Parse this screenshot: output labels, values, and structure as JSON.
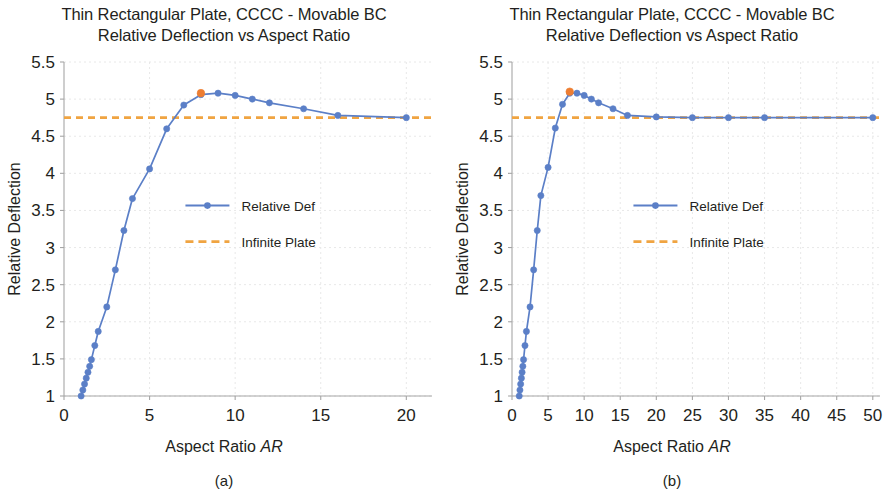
{
  "figure": {
    "panels": [
      {
        "id": "panel-a",
        "caption": "(a)",
        "title_line1": "Thin Rectangular Plate, CCCC - Movable BC",
        "title_line2": "Relative Deflection vs Aspect Ratio",
        "xlabel_text": "Aspect Ratio ",
        "xlabel_italic": "AR",
        "ylabel": "Relative Deflection",
        "legend": [
          {
            "label": "Relative Def",
            "style": "line-marker",
            "color": "#5b7fc7"
          },
          {
            "label": "Infinite Plate",
            "style": "dashed",
            "color": "#f0a441"
          }
        ]
      },
      {
        "id": "panel-b",
        "caption": "(b)",
        "title_line1": "Thin Rectangular Plate, CCCC - Movable BC",
        "title_line2": "Relative Deflection vs Aspect Ratio",
        "xlabel_text": "Aspect Ratio ",
        "xlabel_italic": "AR",
        "ylabel": "Relative Deflection",
        "legend": [
          {
            "label": "Relative Def",
            "style": "line-marker",
            "color": "#5b7fc7"
          },
          {
            "label": "Infinite Plate",
            "style": "dashed",
            "color": "#f0a441"
          }
        ]
      }
    ],
    "colors": {
      "series_blue": "#5b7fc7",
      "highlight_orange": "#ed7d31",
      "infinite_orange": "#f0a441",
      "axis": "#a6a6a6",
      "grid": "#e8e8e8",
      "text": "#231f20"
    }
  },
  "chart_data": [
    {
      "type": "line",
      "panel": "(a)",
      "title": "Thin Rectangular Plate, CCCC - Movable BC\nRelative Deflection vs Aspect Ratio",
      "xlabel": "Aspect Ratio AR",
      "ylabel": "Relative Deflection",
      "xlim": [
        0,
        21.5
      ],
      "ylim": [
        1,
        5.5
      ],
      "xticks": [
        0,
        5,
        10,
        15,
        20
      ],
      "yticks": [
        1,
        1.5,
        2,
        2.5,
        3,
        3.5,
        4,
        4.5,
        5,
        5.5
      ],
      "grid": true,
      "legend_position": "center-left-inside",
      "series": [
        {
          "name": "Relative Def",
          "color": "#5b7fc7",
          "marker": "circle",
          "x": [
            1,
            1.1,
            1.2,
            1.3,
            1.4,
            1.5,
            1.6,
            1.8,
            2,
            2.5,
            3,
            3.5,
            4,
            5,
            6,
            7,
            8,
            9,
            10,
            11,
            12,
            14,
            16,
            20
          ],
          "y": [
            1.0,
            1.08,
            1.16,
            1.24,
            1.32,
            1.4,
            1.49,
            1.68,
            1.87,
            2.2,
            2.7,
            3.23,
            3.66,
            4.06,
            4.6,
            4.92,
            5.06,
            5.08,
            5.05,
            5.0,
            4.95,
            4.87,
            4.78,
            4.75,
            4.74,
            4.74
          ]
        },
        {
          "name": "Infinite Plate",
          "color": "#f0a441",
          "style": "dashed",
          "constant_value": 4.75
        }
      ],
      "highlight_point": {
        "x": 8,
        "y": 5.08,
        "color": "#ed7d31"
      }
    },
    {
      "type": "line",
      "panel": "(b)",
      "title": "Thin Rectangular Plate, CCCC - Movable BC\nRelative Deflection vs Aspect Ratio",
      "xlabel": "Aspect Ratio AR",
      "ylabel": "Relative Deflection",
      "xlim": [
        0,
        51
      ],
      "ylim": [
        1,
        5.5
      ],
      "xticks": [
        0,
        5,
        10,
        15,
        20,
        25,
        30,
        35,
        40,
        45,
        50
      ],
      "yticks": [
        1,
        1.5,
        2,
        2.5,
        3,
        3.5,
        4,
        4.5,
        5,
        5.5
      ],
      "grid": true,
      "legend_position": "center-left-inside",
      "series": [
        {
          "name": "Relative Def",
          "color": "#5b7fc7",
          "marker": "circle",
          "x": [
            1,
            1.1,
            1.2,
            1.3,
            1.4,
            1.5,
            1.6,
            1.8,
            2,
            2.5,
            3,
            3.5,
            4,
            5,
            6,
            7,
            8,
            9,
            10,
            11,
            12,
            14,
            16,
            20,
            25,
            30,
            35,
            50
          ],
          "y": [
            1.0,
            1.08,
            1.16,
            1.24,
            1.32,
            1.4,
            1.49,
            1.68,
            1.87,
            2.2,
            2.7,
            3.23,
            3.7,
            4.08,
            4.61,
            4.93,
            5.08,
            5.08,
            5.05,
            5.0,
            4.95,
            4.87,
            4.78,
            4.76,
            4.75,
            4.75,
            4.75,
            4.75
          ]
        },
        {
          "name": "Infinite Plate",
          "color": "#f0a441",
          "style": "dashed",
          "constant_value": 4.75
        }
      ],
      "highlight_point": {
        "x": 8,
        "y": 5.1,
        "color": "#ed7d31"
      }
    }
  ]
}
